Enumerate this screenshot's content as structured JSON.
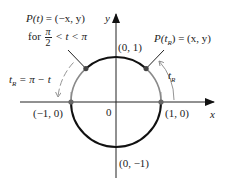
{
  "diagram": {
    "type": "unit-circle",
    "colors": {
      "axis": "#222222",
      "arc_highlight": "#111111",
      "arc_gray": "#8a8a8a",
      "point": "#555555",
      "text": "#222222"
    },
    "axes": {
      "x_label": "x",
      "y_label": "y",
      "origin_label": "0"
    },
    "points": {
      "top": "(0, 1)",
      "bottom": "(0, −1)",
      "left": "(−1, 0)",
      "right": "(1, 0)"
    },
    "annotations": {
      "p_t_line1_lhs": "P(t)",
      "p_t_line1_eq": " = (−x, y)",
      "p_t_line2_for": "for ",
      "p_t_line2_frac_num": "π",
      "p_t_line2_frac_den": "2",
      "p_t_line2_rest": " < t < π",
      "p_tr_lhs": "P(t",
      "p_tr_sub": "R",
      "p_tr_rhs": ") = (x, y)",
      "tr_eq_lhs": "t",
      "tr_eq_sub": "R",
      "tr_eq_rhs": " = π − t",
      "tr_arc_lhs": "t",
      "tr_arc_sub": "R"
    }
  }
}
